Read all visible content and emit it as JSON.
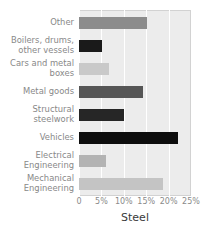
{
  "chart_data": {
    "type": "bar",
    "orientation": "horizontal",
    "title": "",
    "xlabel": "Steel",
    "ylabel": "",
    "categories": [
      "Other",
      "Boilers, drums,\nother vessels",
      "Cars and metal\nboxes",
      "Metal goods",
      "Structural\nsteelwork",
      "Vehicles",
      "Electrical\nEngineering",
      "Mechanical\nEngineering"
    ],
    "values": [
      15.2,
      5.1,
      6.7,
      14.3,
      10.0,
      22.1,
      6.0,
      18.8
    ],
    "bar_colors": [
      "#8c8c8c",
      "#1a1a1a",
      "#c9c9c9",
      "#565656",
      "#262626",
      "#0d0d0d",
      "#b3b3b3",
      "#c4c4c4"
    ],
    "xlim": [
      0,
      25
    ],
    "xticks": [
      0,
      5,
      10,
      15,
      20,
      25
    ],
    "xtick_labels": [
      "0",
      "5%",
      "10%",
      "15%",
      "20%",
      "25%"
    ],
    "grid": true,
    "grid_axis": "x",
    "legend": false,
    "plot_background": "#ececec",
    "gridline_color": "#ffffff",
    "label_color": "#888888",
    "axis_title_color": "#3a3a3a"
  },
  "axis": {
    "title": "Steel"
  }
}
